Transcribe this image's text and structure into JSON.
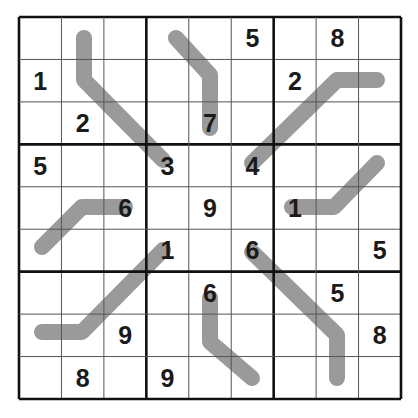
{
  "puzzle": {
    "type": "sudoku-variant",
    "grid_size": 9,
    "colors": {
      "background": "#ffffff",
      "line_path": "#9a9a9a",
      "grid_thin": "#555555",
      "grid_thick": "#111111",
      "digit": "#1a1a1a"
    },
    "givens": [
      [
        "",
        "",
        "",
        "",
        "",
        "5",
        "",
        "8",
        ""
      ],
      [
        "1",
        "",
        "",
        "",
        "",
        "",
        "2",
        "",
        ""
      ],
      [
        "",
        "2",
        "",
        "",
        "7",
        "",
        "",
        "",
        ""
      ],
      [
        "5",
        "",
        "",
        "3",
        "",
        "4",
        "",
        "",
        ""
      ],
      [
        "",
        "",
        "6",
        "",
        "9",
        "",
        "1",
        "",
        ""
      ],
      [
        "",
        "",
        "",
        "1",
        "",
        "6",
        "",
        "",
        "5"
      ],
      [
        "",
        "",
        "",
        "",
        "6",
        "",
        "",
        "5",
        ""
      ],
      [
        "",
        "",
        "9",
        "",
        "",
        "",
        "",
        "",
        "8"
      ],
      [
        "",
        "8",
        "",
        "9",
        "",
        "",
        "",
        "",
        ""
      ]
    ],
    "lines": [
      {
        "id": "A",
        "points": [
          [
            84,
            38
          ],
          [
            84,
            80
          ],
          [
            163,
            160
          ]
        ]
      },
      {
        "id": "B",
        "points": [
          [
            176,
            38
          ],
          [
            210,
            75
          ],
          [
            210,
            128
          ]
        ]
      },
      {
        "id": "C",
        "points": [
          [
            252,
            163
          ],
          [
            337,
            80
          ],
          [
            377,
            80
          ]
        ]
      },
      {
        "id": "D",
        "points": [
          [
            42,
            247
          ],
          [
            82,
            207
          ],
          [
            125,
            207
          ]
        ]
      },
      {
        "id": "E",
        "points": [
          [
            292,
            207
          ],
          [
            334,
            207
          ],
          [
            377,
            163
          ]
        ]
      },
      {
        "id": "F",
        "points": [
          [
            163,
            250
          ],
          [
            82,
            332
          ],
          [
            42,
            332
          ]
        ]
      },
      {
        "id": "G",
        "points": [
          [
            210,
            298
          ],
          [
            210,
            342
          ],
          [
            252,
            378
          ]
        ]
      },
      {
        "id": "H",
        "points": [
          [
            252,
            252
          ],
          [
            337,
            335
          ],
          [
            337,
            378
          ]
        ]
      }
    ]
  }
}
